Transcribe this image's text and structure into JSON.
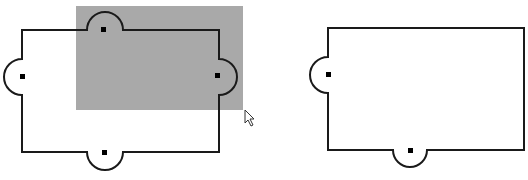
{
  "canvas": {
    "width": 528,
    "height": 180,
    "background": "#ffffff"
  },
  "colors": {
    "stroke": "#1a1a1a",
    "selection_fill": "#a9a9a9",
    "port": "#000000"
  },
  "shapes": [
    {
      "id": "left-component",
      "rect": {
        "x": 22,
        "y": 30,
        "w": 197,
        "h": 122
      },
      "bumps": [
        {
          "side": "top",
          "center": 105,
          "r": 18
        },
        {
          "side": "left",
          "center": 77,
          "r": 18
        },
        {
          "side": "right",
          "center": 77,
          "r": 18
        },
        {
          "side": "bottom",
          "center": 105,
          "r": 18
        }
      ],
      "ports": [
        [
          104,
          30
        ],
        [
          22,
          77
        ],
        [
          218,
          76
        ],
        [
          105,
          152
        ]
      ]
    },
    {
      "id": "right-component",
      "rect": {
        "x": 328,
        "y": 28,
        "w": 196,
        "h": 122
      },
      "bumps": [
        {
          "side": "left",
          "center": 75,
          "r": 18
        },
        {
          "side": "bottom",
          "center": 410,
          "r": 17
        }
      ],
      "ports": [
        [
          328,
          75
        ],
        [
          410,
          150
        ]
      ]
    }
  ],
  "selection": {
    "x": 76,
    "y": 6,
    "w": 167,
    "h": 104
  },
  "cursor": {
    "x": 245,
    "y": 110,
    "icon": "arrow-pointer-icon"
  }
}
